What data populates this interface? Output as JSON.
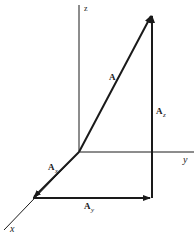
{
  "diagram": {
    "type": "3d-vector-decomposition",
    "axes": [
      {
        "name": "z",
        "label": "z"
      },
      {
        "name": "y",
        "label": "y"
      },
      {
        "name": "x",
        "label": "x"
      }
    ],
    "vectors": [
      {
        "name": "A",
        "label": "A",
        "sub": ""
      },
      {
        "name": "A_x",
        "label": "A",
        "sub": "x"
      },
      {
        "name": "A_y",
        "label": "A",
        "sub": "y"
      },
      {
        "name": "A_z",
        "label": "A",
        "sub": "z"
      }
    ],
    "colors": {
      "ink": "#1a1a1a",
      "background": "#ffffff"
    }
  }
}
